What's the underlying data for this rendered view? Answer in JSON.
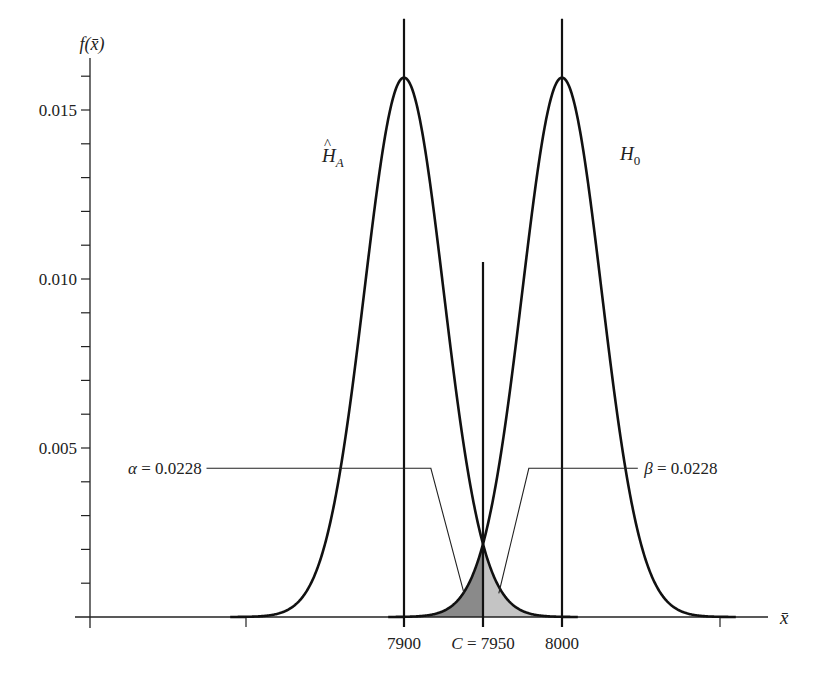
{
  "chart_data": {
    "type": "line",
    "title": "",
    "xlabel": "x̄",
    "ylabel": "f(x̄)",
    "xlim": [
      7690,
      8140
    ],
    "ylim": [
      0,
      0.0165
    ],
    "grid": false,
    "x_ticks": [
      7800,
      7900,
      7950,
      8000,
      8100
    ],
    "x_tick_labels": [
      {
        "value": 7900,
        "label": "7900"
      },
      {
        "value": 7950,
        "label": "C = 7950"
      },
      {
        "value": 8000,
        "label": "8000"
      }
    ],
    "y_ticks": [
      0.001,
      0.002,
      0.003,
      0.004,
      0.005,
      0.006,
      0.007,
      0.008,
      0.009,
      0.01,
      0.011,
      0.012,
      0.013,
      0.014,
      0.015,
      0.016
    ],
    "y_tick_labels": [
      {
        "value": 0.005,
        "label": "0.005"
      },
      {
        "value": 0.01,
        "label": "0.010"
      },
      {
        "value": 0.015,
        "label": "0.015"
      }
    ],
    "series": [
      {
        "name": "H_A",
        "label_main": "Ĥ",
        "label_sub": "A",
        "distribution": "normal",
        "mean": 7900,
        "sd": 25,
        "peak": 0.016
      },
      {
        "name": "H_0",
        "label_main": "H",
        "label_sub": "0",
        "distribution": "normal",
        "mean": 8000,
        "sd": 25,
        "peak": 0.016
      }
    ],
    "vertical_lines": [
      {
        "x": 7900,
        "top": 0.0177
      },
      {
        "x": 7950,
        "top": 0.0105,
        "label": "C = 7950"
      },
      {
        "x": 8000,
        "top": 0.0177
      }
    ],
    "shaded_regions": [
      {
        "name": "alpha",
        "from_series": "H_0",
        "x_from": 7915,
        "x_to": 7950,
        "color": "#8a8a8a"
      },
      {
        "name": "beta",
        "from_series": "H_A",
        "x_from": 7950,
        "x_to": 7985,
        "color": "#c4c4c4"
      }
    ],
    "annotations": [
      {
        "symbol": "α",
        "text": "α = 0.0228",
        "value": 0.0228,
        "label_x": 7690,
        "label_y": 0.0044,
        "elbow_x": 7917,
        "point_x": 7938,
        "point_y": 0.0007
      },
      {
        "symbol": "β",
        "text": "β = 0.0228",
        "value": 0.0228,
        "label_x": 8050,
        "label_y": 0.0044,
        "elbow_x": 7979,
        "point_x": 7960,
        "point_y": 0.0007
      }
    ],
    "colors": {
      "curve": "#111111",
      "axis": "#222222",
      "alpha_fill": "#8a8a8a",
      "beta_fill": "#c4c4c4"
    }
  }
}
